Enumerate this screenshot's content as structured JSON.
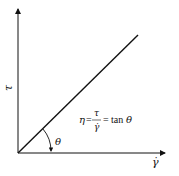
{
  "diagram": {
    "type": "newtonian-fluid-shear-stress-vs-shear-rate",
    "y_axis_label": "τ",
    "x_axis_label": "γ̇",
    "angle_label": "θ",
    "formula": {
      "lhs": "η",
      "eq1": "=",
      "numerator": "τ",
      "denominator": "γ̇",
      "eq2": "=",
      "rhs_func": "tan",
      "rhs_arg": "θ"
    },
    "line_color": "#111111"
  }
}
